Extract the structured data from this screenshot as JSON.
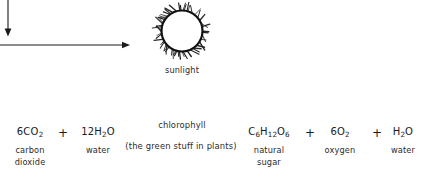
{
  "diagram": {
    "ink_color": "#1a1a1a",
    "background": "#ffffff",
    "sun": {
      "icon": "sun-icon",
      "label": "sunlight",
      "ray_count": 34
    },
    "catalyst": {
      "primary": "chlorophyll",
      "secondary": "(the green stuff in plants)"
    },
    "arrows": {
      "sunlight_down": "arrow-down",
      "reaction_right": "arrow-right"
    },
    "operators": {
      "plus": "+"
    },
    "reactants": [
      {
        "formula_prefix": "6",
        "formula_parts": [
          {
            "text": "CO",
            "sub": "2"
          }
        ],
        "name_line1": "carbon",
        "name_line2": "dioxide"
      },
      {
        "formula_prefix": "12",
        "formula_parts": [
          {
            "text": "H",
            "sub": "2"
          },
          {
            "text": "O",
            "sub": ""
          }
        ],
        "name_line1": "water",
        "name_line2": ""
      }
    ],
    "products": [
      {
        "formula_prefix": "",
        "formula_parts": [
          {
            "text": "C",
            "sub": "6"
          },
          {
            "text": "H",
            "sub": "12"
          },
          {
            "text": "O",
            "sub": "6"
          }
        ],
        "name_line1": "natural",
        "name_line2": "sugar"
      },
      {
        "formula_prefix": "6",
        "formula_parts": [
          {
            "text": "O",
            "sub": "2"
          }
        ],
        "name_line1": "oxygen",
        "name_line2": ""
      },
      {
        "formula_prefix": "",
        "formula_parts": [
          {
            "text": "H",
            "sub": "2"
          },
          {
            "text": "O",
            "sub": ""
          }
        ],
        "name_line1": "water",
        "name_line2": ""
      }
    ]
  }
}
